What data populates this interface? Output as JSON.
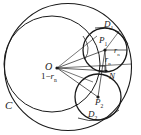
{
  "figure": {
    "type": "geometry-diagram",
    "background": "#ffffff",
    "stroke_color": "#1a1a1a",
    "label_color": "#1a1a1a"
  },
  "labels": {
    "outer_circle": "C",
    "center": "O",
    "point_p1": "P",
    "point_p1_sub": "1",
    "point_p2": "P",
    "point_p2_sub": "2",
    "point_n": "N",
    "region_d1": "D",
    "region_d1_sub": "1",
    "region_d2": "D",
    "region_d2_sub": "2",
    "radius_1": "r",
    "radius_1_sub": "n",
    "radius_2": "r",
    "radius_2_sub": "n",
    "distance_prefix": "1",
    "distance_minus": "−",
    "distance_radius": "r",
    "distance_radius_sub": "n"
  },
  "geometry": {
    "outer_circle": {
      "cx": 68,
      "cy": 67,
      "r": 64
    },
    "inner_big_circle": {
      "cx": 53,
      "cy": 64,
      "r": 48
    },
    "circle_p1": {
      "cx": 105,
      "cy": 50,
      "r": 22
    },
    "circle_p2": {
      "cx": 98,
      "cy": 97,
      "r": 23
    },
    "center_o": {
      "cx": 57,
      "cy": 68
    },
    "point_p1": {
      "cx": 105,
      "cy": 50
    },
    "point_p2": {
      "cx": 98,
      "cy": 97
    },
    "point_n": {
      "cx": 108,
      "cy": 71
    }
  }
}
